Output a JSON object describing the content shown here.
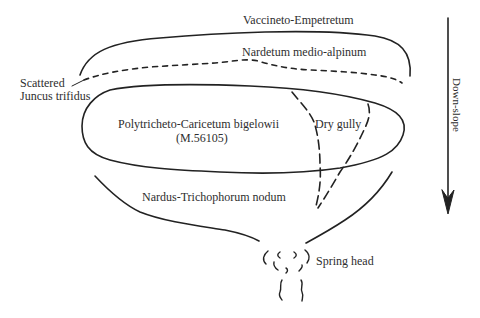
{
  "diagram": {
    "title": "",
    "labels": {
      "vaccineto": "Vaccineto-Empetretum",
      "nardetum": "Nardetum medio-alpinum",
      "scattered_line1": "Scattered",
      "scattered_line2": "Juncus trifidus",
      "polytricheto_line1": "Polytricheto-Caricetum bigelowii",
      "polytricheto_line2": "(M.56105)",
      "dry_gully": "Dry gully",
      "nardus": "Nardus-Trichophorum  nodum",
      "spring_head": "Spring head",
      "down_slope": "Down-slope"
    },
    "colors": {
      "ink": "#222222",
      "background": "#ffffff"
    },
    "regions": [
      {
        "name": "Vaccineto-Empetretum",
        "shape": "arc-band",
        "position": "top"
      },
      {
        "name": "Nardetum medio-alpinum",
        "shape": "dashed-line",
        "position": "upper"
      },
      {
        "name": "Polytricheto-Caricetum bigelowii (M.56105)",
        "shape": "closed-ellipse",
        "position": "middle"
      },
      {
        "name": "Dry gully",
        "shape": "dashed-parallel-lines",
        "position": "right-middle"
      },
      {
        "name": "Nardus-Trichophorum nodum",
        "shape": "funnel",
        "position": "lower"
      },
      {
        "name": "Spring head",
        "shape": "wavy-marks",
        "position": "bottom"
      }
    ],
    "arrow": {
      "direction": "down",
      "label": "Down-slope"
    }
  }
}
